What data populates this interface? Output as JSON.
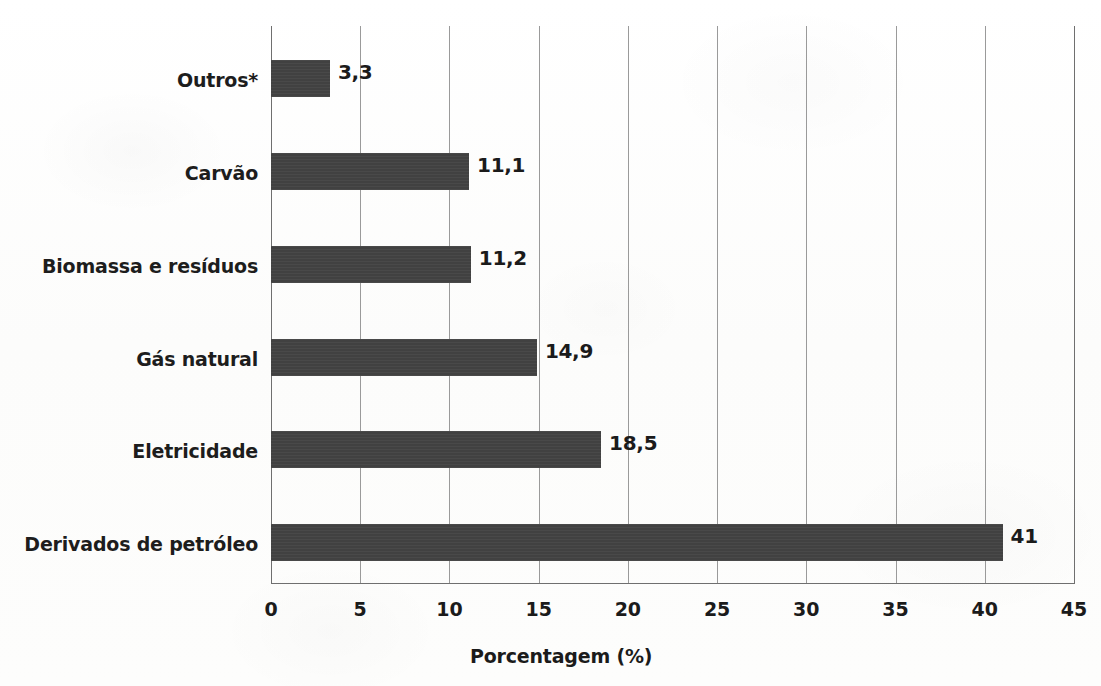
{
  "chart_data": {
    "type": "bar",
    "orientation": "horizontal",
    "title": "",
    "subtitle": "",
    "xlabel": "Porcentagem (%)",
    "ylabel": "",
    "xlim": [
      0,
      45
    ],
    "xticks": [
      "0",
      "5",
      "10",
      "15",
      "20",
      "25",
      "30",
      "35",
      "40",
      "45"
    ],
    "xtick_values": [
      0,
      5,
      10,
      15,
      20,
      25,
      30,
      35,
      40,
      45
    ],
    "grid": "vertical",
    "legend": "none",
    "bar_color": "#414141",
    "categories": [
      "Derivados de petróleo",
      "Eletricidade",
      "Gás natural",
      "Biomassa e resíduos",
      "Carvão",
      "Outros*"
    ],
    "values": [
      41,
      18.5,
      14.9,
      11.2,
      11.1,
      3.3
    ],
    "data_labels": [
      "41",
      "18,5",
      "14,9",
      "11,2",
      "11,1",
      "3,3"
    ],
    "bars": [
      {
        "category": "Outros*",
        "value": 3.3,
        "label": "3,3"
      },
      {
        "category": "Carvão",
        "value": 11.1,
        "label": "11,1"
      },
      {
        "category": "Biomassa e resíduos",
        "value": 11.2,
        "label": "11,2"
      },
      {
        "category": "Gás natural",
        "value": 14.9,
        "label": "14,9"
      },
      {
        "category": "Eletricidade",
        "value": 18.5,
        "label": "18,5"
      },
      {
        "category": "Derivados de petróleo",
        "value": 41,
        "label": "41"
      }
    ]
  }
}
